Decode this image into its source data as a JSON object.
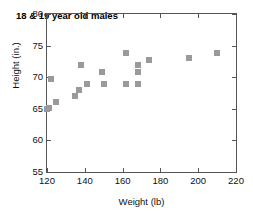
{
  "chart_data": {
    "type": "scatter",
    "title": "18 & 19 year old males",
    "xlabel": "Weight (lb)",
    "ylabel": "Height (in.)",
    "xlim": [
      120,
      220
    ],
    "ylim": [
      55,
      80
    ],
    "xticks": [
      120,
      140,
      160,
      180,
      200,
      220
    ],
    "yticks": [
      55,
      60,
      65,
      70,
      75,
      80
    ],
    "grid": false,
    "legend": null,
    "marker": {
      "shape": "square",
      "color": "#9a9a9a",
      "size": 6
    },
    "axis_color": "#555555",
    "points": [
      {
        "x": 120,
        "y": 65.0
      },
      {
        "x": 121,
        "y": 65.1
      },
      {
        "x": 122,
        "y": 69.7
      },
      {
        "x": 125,
        "y": 66.0
      },
      {
        "x": 135,
        "y": 67.0
      },
      {
        "x": 137,
        "y": 68.0
      },
      {
        "x": 138,
        "y": 71.9
      },
      {
        "x": 141,
        "y": 69.0
      },
      {
        "x": 149,
        "y": 70.9
      },
      {
        "x": 150,
        "y": 69.0
      },
      {
        "x": 162,
        "y": 73.9
      },
      {
        "x": 162,
        "y": 68.9
      },
      {
        "x": 168,
        "y": 72.0
      },
      {
        "x": 168,
        "y": 70.9
      },
      {
        "x": 168,
        "y": 68.9
      },
      {
        "x": 174,
        "y": 72.8
      },
      {
        "x": 195,
        "y": 73.0
      },
      {
        "x": 210,
        "y": 73.9
      }
    ]
  }
}
